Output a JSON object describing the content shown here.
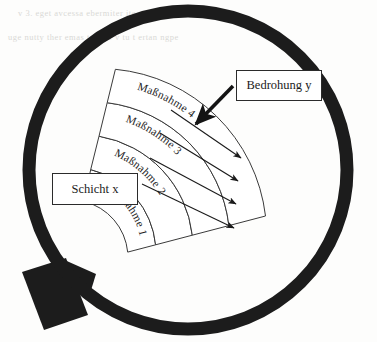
{
  "figure": {
    "title_context": "Magnifying glass diagram of layered protective measures",
    "background_color": "#fdfdfc",
    "ink_color": "#1b1b1b",
    "lens": {
      "name": "magnifier-lens",
      "center_x": 188,
      "center_y": 170,
      "radius": 159,
      "stroke_width": 13,
      "color": "#1c1c1c"
    },
    "handle": {
      "name": "magnifier-handle",
      "color": "#1c1c1c",
      "x": 22,
      "y": 268,
      "width": 62,
      "height": 52,
      "rotation_deg": -18
    },
    "bands": [
      {
        "label": "Maßnahme 1",
        "index": 1,
        "inner_radius": 58,
        "outer_radius": 86
      },
      {
        "label": "Maßnahme 2",
        "index": 2,
        "inner_radius": 86,
        "outer_radius": 113
      },
      {
        "label": "Maßnahme 3",
        "index": 3,
        "inner_radius": 113,
        "outer_radius": 140
      },
      {
        "label": "Maßnahme 4",
        "index": 4,
        "inner_radius": 140,
        "outer_radius": 167
      }
    ],
    "band_geometry": {
      "center_x": 70,
      "center_y": 258,
      "start_angle_deg": -76,
      "end_angle_deg": -6,
      "stroke_color": "#3a3a3a",
      "stroke_width": 1
    },
    "threat_arrows": {
      "name": "threat-arrows",
      "count": 4,
      "color": "#1b1b1b",
      "description": "thin arrows piercing the bands outward to the lower right"
    },
    "pointer_arrow": {
      "name": "bedrohung-pointer-arrow",
      "color": "#141414",
      "description": "thick arrow from the Bedrohung y box to the outer band"
    }
  },
  "callouts": {
    "layer": {
      "name": "schicht-x",
      "label": "Schicht x"
    },
    "threat": {
      "name": "bedrohung-y",
      "label": "Bedrohung y"
    }
  },
  "scan_artifacts": {
    "visible": true,
    "description": "faint grey bleed-through text from the reverse of the scanned page",
    "lines": [
      "v 3. eget avcessa ebermiter ite aucereitta",
      "uge nutty ther emas tet ilte v tu t ertan ngpe"
    ]
  }
}
